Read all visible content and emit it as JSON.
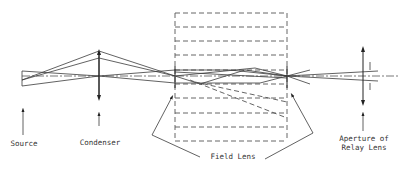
{
  "diagram": {
    "type": "optical-ray-diagram",
    "optical_axis_y": 76,
    "labels": {
      "source": "Source",
      "condenser": "Condenser",
      "field_lens": "Field Lens",
      "relay_aperture_line1": "Aperture of",
      "relay_aperture_line2": "Relay Lens"
    },
    "elements": [
      {
        "name": "Source",
        "x": 22
      },
      {
        "name": "Condenser",
        "x": 99
      },
      {
        "name": "Field Lens (left)",
        "x": 175
      },
      {
        "name": "Field Lens (right)",
        "x": 287
      },
      {
        "name": "Aperture of Relay Lens",
        "x": 363
      }
    ],
    "colors": {
      "stroke": "#3a3a3a",
      "background": "#ffffff"
    }
  }
}
